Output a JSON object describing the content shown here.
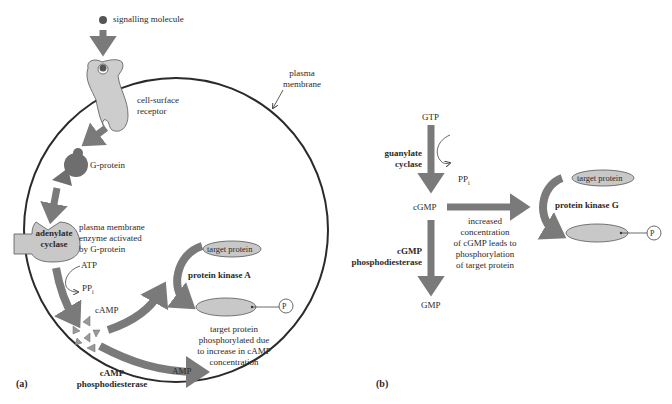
{
  "panel_a": {
    "label": "(a)",
    "signalling_molecule": "signalling molecule",
    "plasma_membrane": [
      "plasma",
      "membrane"
    ],
    "cell_surface_receptor": [
      "cell-surface",
      "receptor"
    ],
    "g_protein": "G-protein",
    "adenylate_cyclase": [
      "adenylate",
      "cyclase"
    ],
    "enzyme_note": [
      "plasma membrane",
      "enzyme activated",
      "by G-protein"
    ],
    "atp": "ATP",
    "ppi": "PP",
    "ppi_sub": "i",
    "camp": "cAMP",
    "target_protein": "target protein",
    "protein_kinase": "protein kinase A",
    "phospho": "P",
    "phosphorylated_note": [
      "target protein",
      "phosphorylated due",
      "to increase in cAMP",
      "concentration"
    ],
    "phosphodiesterase": [
      "cAMP",
      "phosphodiesterase"
    ],
    "amp": "AMP"
  },
  "panel_b": {
    "label": "(b)",
    "gtp": "GTP",
    "guanylate_cyclase": [
      "guanylate",
      "cyclase"
    ],
    "ppi": "PP",
    "ppi_sub": "i",
    "cgmp": "cGMP",
    "increase_note": [
      "increased",
      "concentration",
      "of cGMP leads to",
      "phosphorylation",
      "of target protein"
    ],
    "phosphodiesterase": [
      "cGMP",
      "phosphodiesterase"
    ],
    "gmp": "GMP",
    "target_protein": "target protein",
    "protein_kinase": "protein kinase G",
    "phospho": "P"
  },
  "colors": {
    "arrow": "#7a7a7a",
    "shape_fill": "#c8c8c8",
    "dark_shape": "#6e6e6e",
    "membrane": "#2a2a2a"
  }
}
